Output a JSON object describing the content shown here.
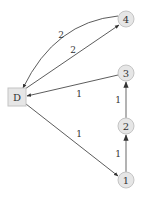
{
  "diagram": {
    "type": "directed-weighted-graph",
    "colors": {
      "node_fill": "#e6e6e6",
      "node_stroke": "#c4c4c4",
      "edge": "#4a4a4a",
      "text": "#333333"
    },
    "nodes": [
      {
        "id": "D",
        "label": "D",
        "shape": "square",
        "x": 17,
        "y": 97
      },
      {
        "id": "1",
        "label": "1",
        "shape": "circle",
        "x": 126,
        "y": 180
      },
      {
        "id": "2",
        "label": "2",
        "shape": "circle",
        "x": 126,
        "y": 126
      },
      {
        "id": "3",
        "label": "3",
        "shape": "circle",
        "x": 126,
        "y": 73
      },
      {
        "id": "4",
        "label": "4",
        "shape": "circle",
        "x": 126,
        "y": 19
      }
    ],
    "edges": [
      {
        "from": "4",
        "to": "D",
        "weight": "2",
        "curved": true
      },
      {
        "from": "D",
        "to": "4",
        "weight": "2",
        "curved": false
      },
      {
        "from": "3",
        "to": "D",
        "weight": "1",
        "curved": false
      },
      {
        "from": "D",
        "to": "1",
        "weight": "1",
        "curved": false
      },
      {
        "from": "1",
        "to": "2",
        "weight": "1",
        "curved": false
      },
      {
        "from": "2",
        "to": "3",
        "weight": "1",
        "curved": false
      }
    ]
  }
}
